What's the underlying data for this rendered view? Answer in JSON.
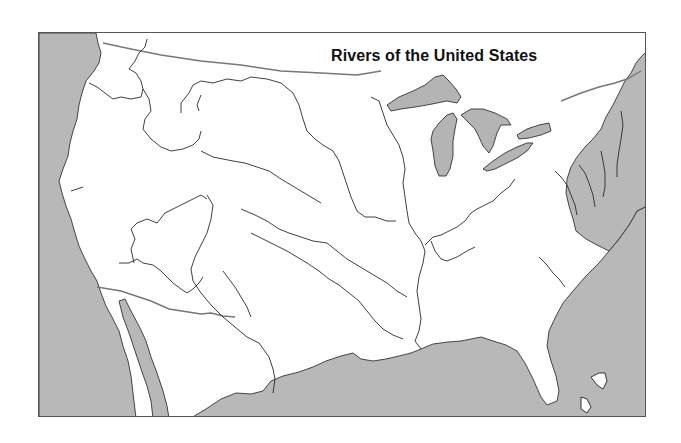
{
  "map": {
    "title": "Rivers of the United States",
    "colors": {
      "water": "#b8b8b8",
      "land": "#ffffff",
      "river": "#2a2a2a",
      "border": "#777777",
      "frame": "#555555"
    },
    "water_bodies": [
      {
        "name": "pacific-ocean",
        "d": "M38,32 L95,32 L97,42 L100,52 L98,62 L93,70 L85,80 L81,92 L78,104 L76,118 L72,130 L69,142 L67,155 L62,168 L58,180 L61,192 L65,205 L70,218 L74,232 L78,245 L84,258 L90,270 L96,280 L100,292 L105,305 L112,318 L118,330 L122,345 L127,360 L130,375 L132,392 L135,417 L38,417 Z"
      },
      {
        "name": "gulf-of-california",
        "d": "M118,300 L124,298 L130,310 L138,325 L145,340 L150,356 L156,372 L162,390 L166,405 L168,417 L152,417 L150,400 L146,385 L140,368 L134,350 L128,332 L122,316 Z"
      },
      {
        "name": "gulf-of-mexico",
        "d": "M190,417 L205,408 L220,398 L235,392 L250,393 L262,390 L270,380 L282,375 L298,371 L312,366 L325,360 L340,355 L352,352 L360,358 L372,360 L385,358 L398,355 L410,352 L420,348 L432,343 L447,341 L460,340 L470,338 L480,336 L492,340 L505,344 L516,350 L524,362 L532,378 L540,396 L546,404 L556,400 L558,390 L555,375 L550,360 L546,345 L548,330 L555,315 L562,302 L572,290 L584,276 L598,262 L608,250 L618,238 L628,224 L636,210 L646,205 L646,417 Z"
      },
      {
        "name": "atlantic-ocean",
        "d": "M646,50 L640,56 L635,62 L630,72 L624,80 L618,92 L612,104 L605,116 L600,128 L592,138 L584,146 L576,156 L570,166 L566,178 L565,192 L568,205 L572,218 L575,230 L585,238 L596,244 L608,250 L618,238 L628,224 L636,210 L646,205 Z"
      }
    ],
    "lakes": [
      {
        "name": "lake-superior",
        "d": "M386,104 L398,96 L412,90 L424,84 L434,76 L442,74 L448,80 L455,88 L460,96 L456,102 L446,100 L436,102 L426,104 L414,106 L400,108 L390,110 Z"
      },
      {
        "name": "lake-michigan",
        "d": "M432,130 L438,122 L446,114 L452,112 L456,118 L454,128 L452,140 L452,155 L449,168 L445,175 L438,175 L434,165 L432,150 L430,138 Z"
      },
      {
        "name": "lake-huron",
        "d": "M460,114 L470,108 L482,108 L494,112 L506,118 L510,124 L500,124 L496,132 L492,145 L488,152 L482,145 L478,136 L474,128 L466,120 Z"
      },
      {
        "name": "lake-erie",
        "d": "M482,168 L492,160 L504,152 L516,146 L526,142 L532,142 L526,150 L516,157 L504,163 L494,168 L486,170 Z"
      },
      {
        "name": "lake-ontario",
        "d": "M516,134 L526,128 L538,124 L548,122 L550,130 L540,134 L528,137 L518,138 Z"
      }
    ],
    "rivers": [
      {
        "name": "columbia-river",
        "d": "M88,82 L96,86 L104,92 L112,98 L120,96 L130,98 L140,96 L142,88 L140,80 L135,72 L128,68 L134,60 L138,52 L144,46 L146,38"
      },
      {
        "name": "snake-river",
        "d": "M142,88 L148,98 L150,110 L144,118 L142,128 L150,138 L160,146 L170,150 L182,148 L192,144 L198,138 L200,130"
      },
      {
        "name": "missouri-river",
        "d": "M180,112 L180,102 L188,92 L192,84 L200,80 L212,82 L226,78 L240,80 L250,76 L266,78 L280,82 L292,92 L298,104 L302,118 L306,130 L314,138 L322,144 L332,150 L338,160 L342,172 L346,184 L350,196 L356,210 L364,216 L374,216 L386,220 L395,220"
      },
      {
        "name": "yellowstone-river",
        "d": "M200,94 L196,104 L198,110"
      },
      {
        "name": "platte-river",
        "d": "M200,150 L212,156 L222,158 L232,160 L244,162 L256,166 L268,170 L280,178 L290,184 L300,190 L310,196 L320,202"
      },
      {
        "name": "mississippi-river",
        "d": "M370,96 L378,100 L382,112 L386,124 L392,134 L398,144 L402,156 L404,168 L402,182 L404,196 L406,210 L408,222 L414,232 L420,240 L424,250 L422,262 L418,276 L416,290 L418,304 L420,318 L418,330 L414,340 L420,348"
      },
      {
        "name": "ohio-river",
        "d": "M424,244 L432,236 L440,234 L448,230 L456,226 L464,220 L470,212 L476,208 L484,204 L492,200 L500,192 L508,186 L514,178"
      },
      {
        "name": "tennessee-river",
        "d": "M430,240 L434,250 L440,258 L446,260 L456,256 L466,250 L474,246"
      },
      {
        "name": "arkansas-river",
        "d": "M240,208 L254,214 L266,220 L278,228 L288,232 L300,236 L312,240 L326,242 L336,250 L346,258 L356,264 L366,270 L376,276 L386,282 L396,290 L406,296"
      },
      {
        "name": "red-river",
        "d": "M250,232 L262,238 L274,244 L286,250 L296,256 L306,262 L318,270 L328,278 L338,284 L348,292 L358,300 L366,310 L374,320 L382,328 L392,334 L402,338"
      },
      {
        "name": "colorado-river",
        "d": "M118,262 L128,262 L136,258 L142,262 L152,264 L160,270 L166,276 L172,282 L180,288 L186,292 L192,288 L198,282 L202,276"
      },
      {
        "name": "colorado-upper",
        "d": "M133,262 L130,248 L134,238 L130,228 L136,222 L146,218 L156,222 L164,212 L176,206 L188,200 L200,194 L206,198"
      },
      {
        "name": "rio-grande",
        "d": "M206,194 L212,204 L210,218 L206,232 L200,244 L194,256 L190,268 L192,280 L200,292 L210,304 L222,316 L234,326 L246,336 L258,342 L268,356 L272,368 L274,378 L272,392"
      },
      {
        "name": "pecos-river",
        "d": "M222,270 L228,278 L234,286 L240,296 L246,306 L250,316"
      },
      {
        "name": "sacramento-river",
        "d": "M70,190 L76,188 L82,186"
      },
      {
        "name": "hudson-river",
        "d": "M600,150 L602,160 L604,172 L604,186 L602,196"
      },
      {
        "name": "connecticut-river",
        "d": "M620,110 L622,124 L620,138 L618,150 L616,164 L616,176"
      },
      {
        "name": "delaware-river",
        "d": "M578,164 L584,172 L588,182 L592,194 L594,206"
      },
      {
        "name": "susquehanna-river",
        "d": "M554,170 L560,176 L566,184 L570,194 L574,204 L576,214"
      },
      {
        "name": "savannah-river",
        "d": "M538,256 L546,264 L552,272 L558,278 L564,286"
      }
    ],
    "borders": [
      {
        "name": "us-canada-border",
        "d": "M102,42 L130,48 L160,54 L200,60 L240,64 L280,70 L320,72 L356,74 L380,70"
      },
      {
        "name": "us-canada-east",
        "d": "M560,100 L580,92 L598,86 L614,82 L626,78 L640,70"
      },
      {
        "name": "us-mexico-border",
        "d": "M96,286 L120,290 L150,300 L168,308 L200,313 L210,312 L222,315 L234,316"
      }
    ],
    "islands": [
      {
        "name": "bahamas-1",
        "d": "M590,376 L598,372 L604,372 L606,380 L602,388 L596,384 Z"
      },
      {
        "name": "bahamas-2",
        "d": "M580,396 L586,398 L590,406 L586,412 L580,408 Z"
      }
    ]
  }
}
